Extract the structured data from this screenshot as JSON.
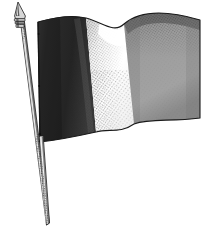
{
  "image": {
    "kind": "engraving-illustration",
    "subject": "waving tricolor flag on pole",
    "title": "Tricolour flag on a staff",
    "style": "black-and-white stipple engraving",
    "width_px": 224,
    "height_px": 230,
    "background_color": "#ffffff"
  },
  "flag": {
    "name": "tricolour-flag",
    "orientation": "waving to the right",
    "stripe_count": 3,
    "stripes": [
      {
        "index": 1,
        "name": "hoist-stripe",
        "tone": "dark",
        "color": "#2f2f2f",
        "shadow_color": "#1b1b1b",
        "highlight_color": "#4a4a4a"
      },
      {
        "index": 2,
        "name": "middle-stripe",
        "tone": "white",
        "color": "#ffffff",
        "shadow_color": "#8d8d8d",
        "highlight_color": "#ffffff"
      },
      {
        "index": 3,
        "name": "fly-stripe",
        "tone": "mid-gray",
        "color": "#9a9a9a",
        "shadow_color": "#4e4e4e",
        "highlight_color": "#b5b5b5"
      }
    ],
    "outline_color": "#1a1a1a",
    "hoist_top_px": [
      38,
      22
    ],
    "hoist_bottom_px": [
      40,
      142
    ],
    "fly_top_px": [
      200,
      20
    ],
    "fly_bottom_px": [
      200,
      118
    ]
  },
  "pole": {
    "name": "flag-pole",
    "color": "#f2f2f2",
    "shading_color": "#3a3a3a",
    "outline_color": "#202020",
    "top_px": [
      20,
      16
    ],
    "bottom_px": [
      48,
      224
    ],
    "tapered": true
  },
  "finial": {
    "name": "spear-point-finial",
    "shape": "spear point with collar bands",
    "color": "#d8d8d8",
    "shadow_color": "#1e1e1e",
    "tip_px": [
      18,
      2
    ],
    "base_px": [
      21,
      28
    ],
    "band_count": 3
  },
  "texture": {
    "name": "stipple-hatching",
    "style": "diagonal stipple dots",
    "dot_color": "#303030",
    "description": "engraved shading across stripe folds"
  }
}
